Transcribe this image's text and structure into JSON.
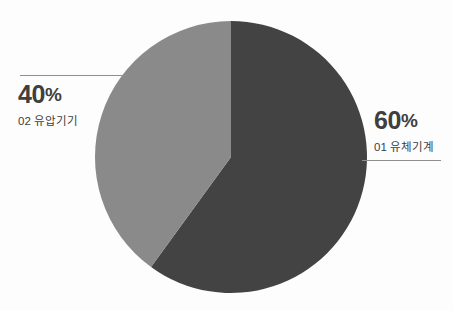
{
  "chart_data": {
    "type": "pie",
    "title": "",
    "subtitle": "",
    "xlabel": "",
    "ylabel": "",
    "legend_position": "callout-labels",
    "grid": false,
    "unit": "%",
    "total": 100,
    "categories": [
      "01 유체기계",
      "02 유압기기"
    ],
    "values": [
      60,
      40
    ],
    "slices": [
      {
        "index": "01",
        "label": "01 유체기계",
        "name": "유체기계",
        "value": 60,
        "value_text": "60",
        "percent_text": "60%",
        "symbol": "%",
        "color": "#434343",
        "start_angle_deg": 0,
        "end_angle_deg": 216,
        "callout_side": "right"
      },
      {
        "index": "02",
        "label": "02 유압기기",
        "name": "유압기기",
        "value": 40,
        "value_text": "40",
        "percent_text": "40%",
        "symbol": "%",
        "color": "#8a8a8a",
        "start_angle_deg": 216,
        "end_angle_deg": 360,
        "callout_side": "left"
      }
    ]
  },
  "callouts": {
    "left": {
      "value_text": "40",
      "symbol": "%",
      "category": "02 유압기기"
    },
    "right": {
      "value_text": "60",
      "symbol": "%",
      "category": "01 유체기계"
    }
  },
  "colors": {
    "background": "#fdfdfd",
    "slice_primary": "#434343",
    "slice_secondary": "#8a8a8a",
    "leader_line": "#8f8f8f",
    "text": "#3f3f3f"
  },
  "geometry": {
    "center_x": 231,
    "center_y": 157,
    "radius": 136
  }
}
